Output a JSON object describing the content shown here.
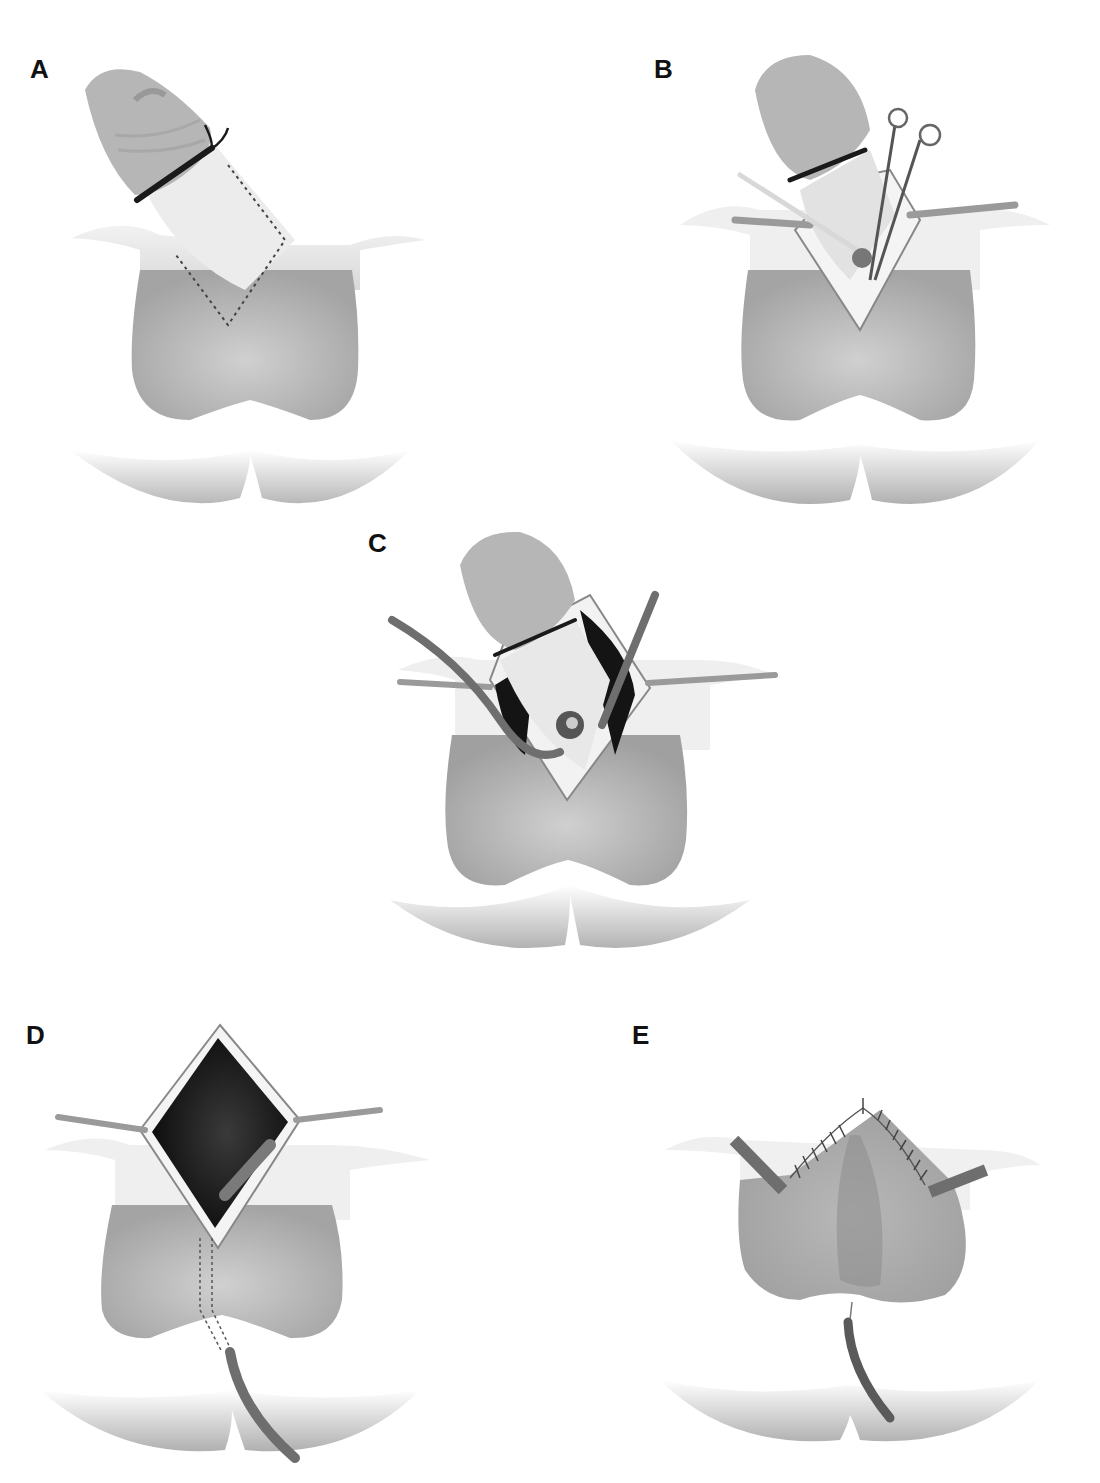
{
  "figure": {
    "panels": [
      {
        "id": "A",
        "label": "A",
        "description": "Penis with tourniquet at base of glans; dotted inverted-V incision line marked on penoscrotal skin"
      },
      {
        "id": "B",
        "label": "B",
        "description": "Skin incised along marked line, flaps retracted with stay sutures; scissors dissecting through incision"
      },
      {
        "id": "C",
        "label": "C",
        "description": "Wide exposure with retraction; two drains placed into dissection cavity"
      },
      {
        "id": "D",
        "label": "D",
        "description": "Dark cavity exposed after penis displaced; drain tunneled through scrotum with dotted track exiting perineum"
      },
      {
        "id": "E",
        "label": "E",
        "description": "Inverted-V incision closed with interrupted sutures; two lateral drains and one perineal drain in place"
      }
    ]
  },
  "colors": {
    "background": "#ffffff",
    "skin_light": "#e6e6e6",
    "skin_mid": "#bdbdbd",
    "skin_dark": "#9a9a9a",
    "glans": "#b4b4b4",
    "tourniquet": "#1a1a1a",
    "cavity": "#141414",
    "drain": "#6e6e6e",
    "label": "#111111"
  }
}
